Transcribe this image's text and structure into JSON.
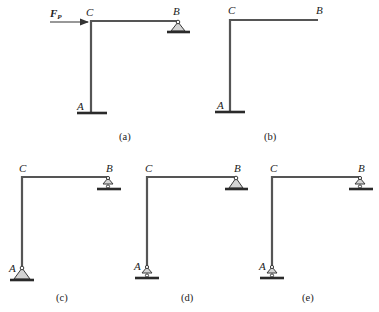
{
  "figures": [
    {
      "id": "a",
      "caption": "(a)",
      "labels": {
        "C": "C",
        "B": "B",
        "A": "A"
      },
      "support_A": "fixed",
      "support_B": "pin",
      "load": {
        "symbol": "F",
        "subscript": "P",
        "direction": "right",
        "at": "C"
      }
    },
    {
      "id": "b",
      "caption": "(b)",
      "labels": {
        "C": "C",
        "B": "B",
        "A": "A"
      },
      "support_A": "fixed",
      "support_B": "free"
    },
    {
      "id": "c",
      "caption": "(c)",
      "labels": {
        "C": "C",
        "B": "B",
        "A": "A"
      },
      "support_A": "pin",
      "support_B": "roller"
    },
    {
      "id": "d",
      "caption": "(d)",
      "labels": {
        "C": "C",
        "B": "B",
        "A": "A"
      },
      "support_A": "roller",
      "support_B": "pin"
    },
    {
      "id": "e",
      "caption": "(e)",
      "labels": {
        "C": "C",
        "B": "B",
        "A": "A"
      },
      "support_A": "roller",
      "support_B": "roller"
    }
  ],
  "colors": {
    "member": "#555555",
    "support_fill": "#d4d4d4",
    "ground": "#2a2a2a"
  }
}
